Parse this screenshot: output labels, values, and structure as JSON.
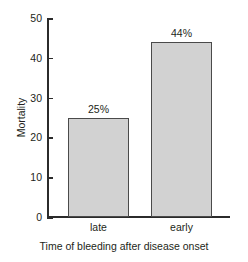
{
  "chart_data": {
    "type": "bar",
    "title": "",
    "subtitle": "",
    "categories": [
      "late",
      "early"
    ],
    "values": [
      25,
      44
    ],
    "value_labels": [
      "25%",
      "44%"
    ],
    "series": [
      {
        "name": "Mortality",
        "values": [
          25,
          44
        ]
      }
    ],
    "xlabel": "Time of bleeding after disease onset",
    "ylabel": "Mortality",
    "ylim": [
      0,
      50
    ],
    "yticks": [
      0,
      10,
      20,
      30,
      40,
      50
    ],
    "ytick_labels": [
      "0",
      "10",
      "20",
      "30",
      "40",
      "50"
    ],
    "grid": false,
    "legend": false,
    "legend_position": "none",
    "colors": {
      "bar_fill": "#d2d2d2",
      "bar_border": "#4a4a4a",
      "axis": "#2b2b2b",
      "text": "#231f20",
      "background": "#ffffff"
    }
  }
}
